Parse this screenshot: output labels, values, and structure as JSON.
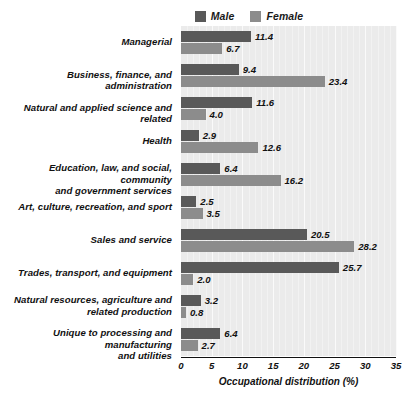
{
  "chart_data": {
    "type": "bar",
    "orientation": "horizontal",
    "title": "",
    "xlabel": "Occupational distribution (%)",
    "ylabel": "",
    "xlim": [
      0,
      35
    ],
    "xticks": [
      0,
      5,
      10,
      15,
      20,
      25,
      30,
      35
    ],
    "grid": true,
    "legend_position": "top-center",
    "categories": [
      "Managerial",
      "Business, finance, and administration",
      "Natural and applied science and related",
      "Health",
      "Education, law, and social, community\nand government services",
      "Art, culture, recreation, and sport",
      "Sales and service",
      "Trades, transport, and equipment",
      "Natural resources, agriculture and\nrelated production",
      "Unique to processing and manufacturing\nand utilities"
    ],
    "series": [
      {
        "name": "Male",
        "color": "#595959",
        "values": [
          11.4,
          9.4,
          11.6,
          2.9,
          6.4,
          2.5,
          20.5,
          25.7,
          3.2,
          6.4
        ]
      },
      {
        "name": "Female",
        "color": "#8c8c8c",
        "values": [
          6.7,
          23.4,
          4.0,
          12.6,
          16.2,
          3.5,
          28.2,
          2.0,
          0.8,
          2.7
        ]
      }
    ]
  }
}
